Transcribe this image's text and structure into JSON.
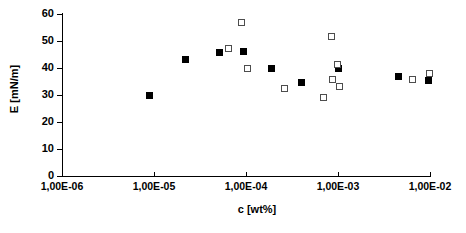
{
  "chart_data": {
    "type": "scatter",
    "title": "",
    "xlabel": "c [wt%]",
    "ylabel": "E [mN/m]",
    "xscale": "log",
    "xlim": [
      1e-06,
      0.01
    ],
    "ylim": [
      0,
      60
    ],
    "grid": false,
    "legend": "none",
    "xticklabels": [
      "1,00E-06",
      "1,00E-05",
      "1,00E-04",
      "1,00E-03",
      "1,00E-02"
    ],
    "xtickvalues": [
      1e-06,
      1e-05,
      0.0001,
      0.001,
      0.01
    ],
    "yticklabels": [
      "0",
      "10",
      "20",
      "30",
      "40",
      "50",
      "60"
    ],
    "ytickvalues": [
      0,
      10,
      20,
      30,
      40,
      50,
      60
    ],
    "series": [
      {
        "name": "filled-squares",
        "marker": "filled-square",
        "color": "#000000",
        "points": [
          {
            "x": 9e-06,
            "y": 30.0
          },
          {
            "x": 2.2e-05,
            "y": 43.0
          },
          {
            "x": 5.2e-05,
            "y": 45.8
          },
          {
            "x": 9.5e-05,
            "y": 46.2
          },
          {
            "x": 0.00019,
            "y": 40.0
          },
          {
            "x": 0.0004,
            "y": 34.8
          },
          {
            "x": 0.001,
            "y": 40.0
          },
          {
            "x": 0.0046,
            "y": 36.7
          },
          {
            "x": 0.0096,
            "y": 35.2
          }
        ]
      },
      {
        "name": "open-squares",
        "marker": "open-square",
        "color": "#4d4d4d",
        "points": [
          {
            "x": 6.5e-05,
            "y": 47.2
          },
          {
            "x": 8.9e-05,
            "y": 57.0
          },
          {
            "x": 0.000105,
            "y": 40.0
          },
          {
            "x": 0.00026,
            "y": 32.4
          },
          {
            "x": 0.0007,
            "y": 29.0
          },
          {
            "x": 0.00085,
            "y": 51.6
          },
          {
            "x": 0.00088,
            "y": 35.6
          },
          {
            "x": 0.00098,
            "y": 41.4
          },
          {
            "x": 0.00105,
            "y": 33.1
          },
          {
            "x": 0.0064,
            "y": 35.6
          },
          {
            "x": 0.0098,
            "y": 37.8
          }
        ]
      }
    ]
  }
}
